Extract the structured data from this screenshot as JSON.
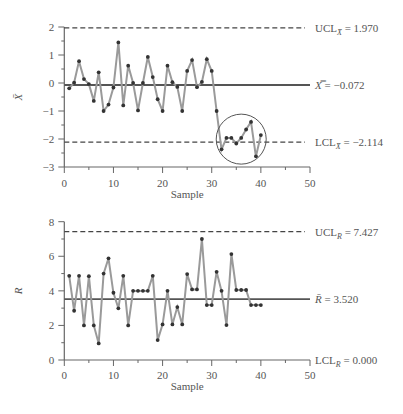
{
  "chart_data": [
    {
      "type": "line",
      "title": "X-bar control chart",
      "xlabel": "Sample",
      "ylabel": "X̄",
      "xlim": [
        0,
        50
      ],
      "ylim": [
        -3,
        2
      ],
      "xticks": [
        0,
        10,
        20,
        30,
        40,
        50
      ],
      "yticks": [
        2,
        1,
        0,
        -1,
        -2,
        -3
      ],
      "grid": false,
      "x": [
        1,
        2,
        3,
        4,
        5,
        6,
        7,
        8,
        9,
        10,
        11,
        12,
        13,
        14,
        15,
        16,
        17,
        18,
        19,
        20,
        21,
        22,
        23,
        24,
        25,
        26,
        27,
        28,
        29,
        30,
        31,
        32,
        33,
        34,
        35,
        36,
        37,
        38,
        39,
        40
      ],
      "values": [
        -0.19,
        0.01,
        0.78,
        0.14,
        -0.04,
        -0.64,
        0.38,
        -1.0,
        -0.77,
        -0.16,
        1.45,
        -0.8,
        0.62,
        0.0,
        -0.98,
        0.0,
        0.93,
        0.21,
        -0.58,
        -1.0,
        0.62,
        0.03,
        -0.14,
        -1.0,
        0.43,
        0.82,
        -0.15,
        0.04,
        0.85,
        0.43,
        -1.0,
        -2.37,
        -1.96,
        -1.96,
        -2.16,
        -1.96,
        -1.66,
        -1.39,
        -2.62,
        -1.86
      ],
      "control_lines": [
        {
          "name": "UCL",
          "label_main": "UCL",
          "label_sub": "X̄",
          "value": 1.97,
          "text": "= 1.970",
          "style": "dashed"
        },
        {
          "name": "Center",
          "label_main": "X̿",
          "label_sub": "",
          "value": -0.072,
          "text": "= −0.072",
          "style": "solid"
        },
        {
          "name": "LCL",
          "label_main": "LCL",
          "label_sub": "X̄",
          "value": -2.114,
          "text": "= −2.114",
          "style": "dashed"
        }
      ],
      "annotations": [
        {
          "type": "circle",
          "around_samples": [
            32,
            40
          ],
          "note": "out-of-control run circled"
        }
      ]
    },
    {
      "type": "line",
      "title": "R control chart",
      "xlabel": "Sample",
      "ylabel": "R",
      "xlim": [
        0,
        50
      ],
      "ylim": [
        0,
        8
      ],
      "xticks": [
        0,
        10,
        20,
        30,
        40,
        50
      ],
      "yticks": [
        0,
        2,
        4,
        6,
        8
      ],
      "grid": false,
      "x": [
        1,
        2,
        3,
        4,
        5,
        6,
        7,
        8,
        9,
        10,
        11,
        12,
        13,
        14,
        15,
        16,
        17,
        18,
        19,
        20,
        21,
        22,
        23,
        24,
        25,
        26,
        27,
        28,
        29,
        30,
        31,
        32,
        33,
        34,
        35,
        36,
        37,
        38,
        39,
        40
      ],
      "values": [
        4.87,
        2.85,
        4.87,
        2.0,
        4.85,
        2.0,
        0.96,
        5.0,
        5.88,
        3.89,
        2.99,
        4.87,
        2.0,
        4.0,
        4.0,
        4.0,
        4.0,
        4.87,
        1.15,
        2.06,
        4.0,
        2.06,
        3.06,
        2.06,
        4.97,
        4.08,
        4.08,
        7.0,
        3.18,
        3.18,
        5.1,
        4.0,
        2.02,
        6.13,
        4.05,
        4.05,
        4.05,
        3.18,
        3.18,
        3.18
      ],
      "control_lines": [
        {
          "name": "UCL",
          "label_main": "UCL",
          "label_sub": "R",
          "value": 7.427,
          "text": "= 7.427",
          "style": "dashed"
        },
        {
          "name": "Center",
          "label_main": "R̄",
          "label_sub": "",
          "value": 3.52,
          "text": "= 3.520",
          "style": "solid"
        },
        {
          "name": "LCL",
          "label_main": "LCL",
          "label_sub": "R",
          "value": 0.0,
          "text": "= 0.000",
          "style": "axis"
        }
      ]
    }
  ],
  "colors": {
    "series_line": "#9a9a9a",
    "marker": "#333333",
    "axis": "#666666",
    "center_line": "#555555",
    "limit_line": "#444444"
  }
}
